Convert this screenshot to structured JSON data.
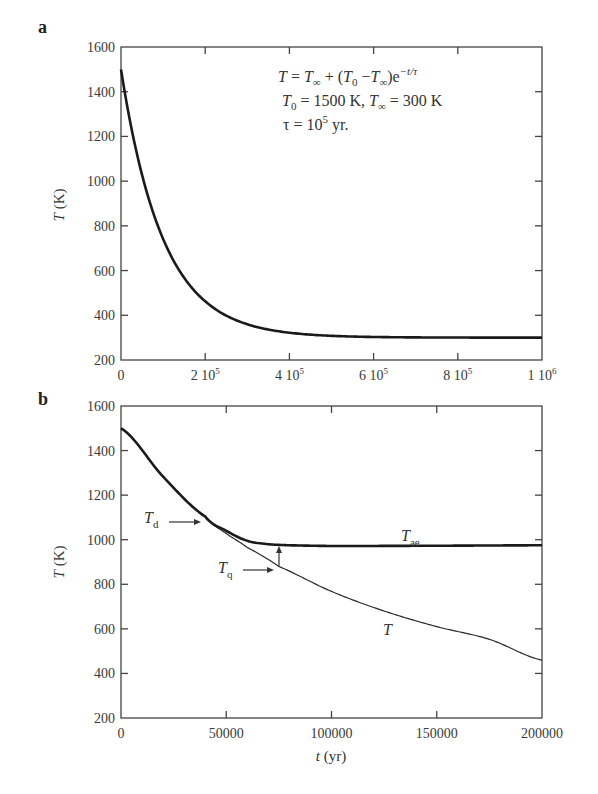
{
  "chart_data": [
    {
      "panel": "a",
      "type": "line",
      "title": "",
      "xlabel": "",
      "ylabel": "T (K)",
      "xlim": [
        0,
        1000000
      ],
      "ylim": [
        200,
        1600
      ],
      "grid": false,
      "x_ticks": [
        0,
        200000,
        400000,
        600000,
        800000,
        1000000
      ],
      "x_tick_labels": [
        "0",
        "2 10^5",
        "4 10^5",
        "6 10^5",
        "8 10^5",
        "1 10^6"
      ],
      "y_ticks": [
        200,
        400,
        600,
        800,
        1000,
        1200,
        1400,
        1600
      ],
      "y_tick_labels": [
        "200",
        "400",
        "600",
        "800",
        "1000",
        "1200",
        "1400",
        "1600"
      ],
      "annotations": [
        "T = T∞ + (T0 − T∞)e^(−t/τ)",
        "T0 = 1500 K, T∞ = 300 K",
        "τ = 10^5 yr."
      ],
      "series": [
        {
          "name": "T",
          "style": "thick",
          "x": [
            0,
            50000,
            100000,
            150000,
            200000,
            250000,
            300000,
            400000,
            500000,
            600000,
            700000,
            800000,
            900000,
            1000000
          ],
          "values": [
            1500,
            1028,
            741,
            568,
            462,
            398,
            360,
            322,
            308,
            303,
            301,
            300,
            300,
            300
          ]
        }
      ]
    },
    {
      "panel": "b",
      "type": "line",
      "title": "",
      "xlabel": "t (yr)",
      "ylabel": "T (K)",
      "xlim": [
        0,
        200000
      ],
      "ylim": [
        200,
        1600
      ],
      "grid": false,
      "x_ticks": [
        0,
        50000,
        100000,
        150000,
        200000
      ],
      "x_tick_labels": [
        "0",
        "50000",
        "100000",
        "150000",
        "200000"
      ],
      "y_ticks": [
        200,
        400,
        600,
        800,
        1000,
        1200,
        1400,
        1600
      ],
      "y_tick_labels": [
        "200",
        "400",
        "600",
        "800",
        "1000",
        "1200",
        "1400",
        "1600"
      ],
      "annotations": [
        "T_d",
        "T_q",
        "T_ae",
        "T"
      ],
      "series": [
        {
          "name": "T",
          "style": "thin",
          "x": [
            0,
            20000,
            40000,
            50000,
            60000,
            75000,
            100000,
            125000,
            150000,
            175000,
            200000
          ],
          "values": [
            1500,
            1283,
            1104,
            1028,
            965,
            880,
            768,
            680,
            610,
            553,
            460
          ]
        },
        {
          "name": "T_ae",
          "style": "thick",
          "x": [
            0,
            20000,
            40000,
            50000,
            60000,
            70000,
            80000,
            100000,
            150000,
            200000
          ],
          "values": [
            1500,
            1283,
            1104,
            1040,
            995,
            980,
            975,
            972,
            973,
            975
          ]
        }
      ]
    }
  ],
  "panels": {
    "a": {
      "label": "a",
      "ylabel_italic": "T",
      "ylabel_unit": " (K)",
      "eq_line1": "T = T∞ + (T0 −T∞)e−t/τ",
      "eq_line2": "T0 = 1500 K, T∞ = 300 K",
      "eq_line3": "τ = 105 yr."
    },
    "b": {
      "label": "b",
      "ylabel_italic": "T",
      "ylabel_unit": " (K)",
      "xlabel_italic": "t",
      "xlabel_unit": " (yr)",
      "label_Td": "T",
      "label_Td_sub": "d",
      "label_Tq": "T",
      "label_Tq_sub": "q",
      "label_Tae": "T",
      "label_Tae_sub": "ae",
      "label_T": "T"
    }
  }
}
